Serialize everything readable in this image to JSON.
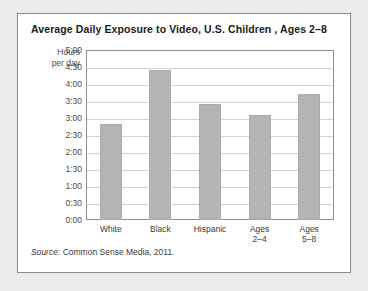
{
  "card": {
    "title": "Average Daily Exposure to Video, U.S. Children , Ages 2–8",
    "axis_unit_line1": "Hours",
    "axis_unit_line2": "per day",
    "source_keyword": "Source:",
    "source_text": " Common Sense Media, 2011."
  },
  "colors": {
    "page_background": "#eceaea",
    "card_background": "#ffffff",
    "card_border": "#8c8c8c",
    "bar_fill": "#b4b4b4",
    "gridline": "#d2d2d2",
    "plot_border": "#8f8f8f",
    "title_text": "#1b1b1b",
    "axis_text": "#4a4a4a"
  },
  "chart_data": {
    "type": "bar",
    "title": "Average Daily Exposure to Video, U.S. Children , Ages 2–8",
    "xlabel": "",
    "ylabel": "Hours per day",
    "categories": [
      "White",
      "Black",
      "Hispanic",
      "Ages\n2–4",
      "Ages\n5–8"
    ],
    "category_labels_flat": [
      "White",
      "Black",
      "Hispanic",
      "Ages 2–4",
      "Ages 5–8"
    ],
    "values": [
      2.83,
      4.42,
      3.42,
      3.08,
      3.7
    ],
    "value_labels": [
      "2:50",
      "4:25",
      "3:25",
      "3:05",
      "3:42"
    ],
    "ylim": [
      0,
      5
    ],
    "ytick_values": [
      5.0,
      4.5,
      4.0,
      3.5,
      3.0,
      2.5,
      2.0,
      1.5,
      1.0,
      0.5,
      0.0
    ],
    "ytick_labels": [
      "5:00",
      "4:30",
      "4:00",
      "3:30",
      "3:00",
      "2:30",
      "2:00",
      "1:30",
      "1:00",
      "0:30",
      "0:00"
    ],
    "grid": true,
    "legend": false,
    "legend_position": "none"
  }
}
